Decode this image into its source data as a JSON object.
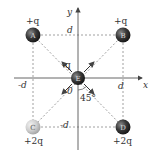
{
  "diagram": {
    "axes": {
      "x_label": "x",
      "y_label": "y",
      "origin_label": "0"
    },
    "distance_labels": {
      "top": "d",
      "right": "d",
      "left": "-d",
      "bottom": "-d"
    },
    "angle_label": "45°",
    "charges": [
      {
        "id": "A",
        "label": "A",
        "charge": "+q",
        "position": "top-left",
        "color": "#3a3a3a"
      },
      {
        "id": "B",
        "label": "B",
        "charge": "+q",
        "position": "top-right",
        "color": "#3a3a3a"
      },
      {
        "id": "C",
        "label": "C",
        "charge": "+2q",
        "position": "bottom-left",
        "color": "#c8c8c8"
      },
      {
        "id": "D",
        "label": "D",
        "charge": "+2q",
        "position": "bottom-right",
        "color": "#3a3a3a"
      },
      {
        "id": "E",
        "label": "E",
        "charge": "-q",
        "position": "origin",
        "color": "#3a3a3a"
      }
    ],
    "colors": {
      "dark_ball": "#3a3a3a",
      "light_ball": "#c8c8c8",
      "line": "#555555",
      "dashed": "#888888"
    }
  }
}
